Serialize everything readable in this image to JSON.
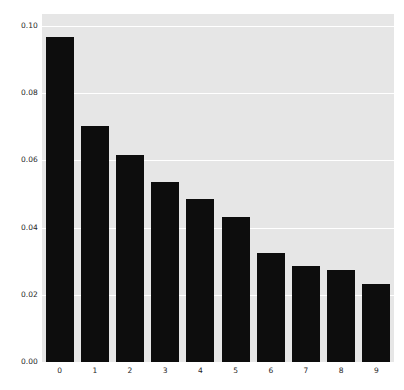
{
  "chart_data": {
    "type": "bar",
    "title": "",
    "subtitle": "",
    "xlabel": "",
    "ylabel": "",
    "categories": [
      "0",
      "1",
      "2",
      "3",
      "4",
      "5",
      "6",
      "7",
      "8",
      "9"
    ],
    "values": [
      0.0967,
      0.0702,
      0.0617,
      0.0537,
      0.0484,
      0.0431,
      0.0325,
      0.0286,
      0.0274,
      0.0233
    ],
    "series": [
      {
        "name": "",
        "values": [
          0.0967,
          0.0702,
          0.0617,
          0.0537,
          0.0484,
          0.0431,
          0.0325,
          0.0286,
          0.0274,
          0.0233
        ]
      }
    ],
    "ylim": [
      0.0,
      0.1036
    ],
    "xlim": [
      -0.5,
      9.5
    ],
    "yticks": [
      0.0,
      0.02,
      0.04,
      0.06,
      0.08,
      0.1
    ],
    "ytick_labels": [
      "0.00",
      "0.02",
      "0.04",
      "0.06",
      "0.08",
      "0.10"
    ],
    "xtick_labels": [
      "0",
      "1",
      "2",
      "3",
      "4",
      "5",
      "6",
      "7",
      "8",
      "9"
    ],
    "grid": true,
    "grid_axis": "y",
    "legend": null,
    "legend_position": "none",
    "annotations": []
  },
  "style": {
    "figure_background": "#ffffff",
    "axes_background": "#e6e6e6",
    "grid_color": "#ffffff",
    "bar_color": "#0d0d0d",
    "tick_label_color": "#262626"
  }
}
